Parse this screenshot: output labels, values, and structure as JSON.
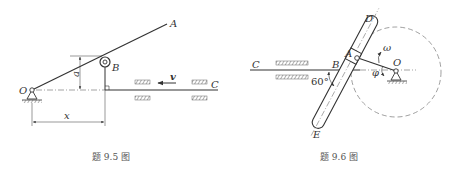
{
  "figures": [
    {
      "id": "fig-9-5",
      "caption": "题 9.5 图",
      "labels": {
        "O": "O",
        "A": "A",
        "B": "B",
        "C": "C",
        "v": "v",
        "a": "a",
        "x": "x"
      },
      "colors": {
        "line": "#333333",
        "hatch": "#555555"
      }
    },
    {
      "id": "fig-9-6",
      "caption": "题 9.6 图",
      "labels": {
        "C": "C",
        "B": "B",
        "A": "A",
        "D": "D",
        "E": "E",
        "O": "O",
        "omega": "ω",
        "phi": "φ",
        "angle": "60°"
      },
      "colors": {
        "line": "#333333",
        "circle": "#666666"
      }
    }
  ]
}
